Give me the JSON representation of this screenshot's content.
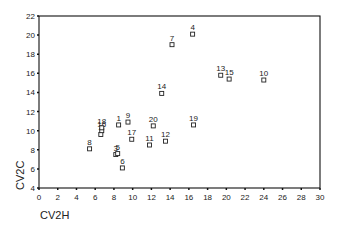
{
  "chart_data": {
    "type": "scatter",
    "title": "",
    "xlabel": "CV2H",
    "ylabel": "CV2C",
    "xlim": [
      0,
      30
    ],
    "ylim": [
      4,
      22
    ],
    "x_ticks": [
      0,
      2,
      4,
      6,
      8,
      10,
      12,
      14,
      16,
      18,
      20,
      22,
      24,
      26,
      28,
      30
    ],
    "y_ticks": [
      4,
      6,
      8,
      10,
      12,
      14,
      16,
      18,
      20,
      22
    ],
    "grid": false,
    "legend": null,
    "marker": "open-square",
    "points": [
      {
        "label": "1",
        "x": 8.5,
        "y": 10.6
      },
      {
        "label": "2",
        "x": 6.6,
        "y": 9.6
      },
      {
        "label": "3",
        "x": 8.2,
        "y": 7.5
      },
      {
        "label": "4",
        "x": 16.4,
        "y": 20.1
      },
      {
        "label": "5",
        "x": 8.4,
        "y": 7.6
      },
      {
        "label": "6",
        "x": 8.9,
        "y": 6.1
      },
      {
        "label": "7",
        "x": 14.2,
        "y": 19.0
      },
      {
        "label": "8",
        "x": 5.4,
        "y": 8.1
      },
      {
        "label": "9",
        "x": 9.5,
        "y": 10.9
      },
      {
        "label": "10",
        "x": 24.0,
        "y": 15.3
      },
      {
        "label": "11",
        "x": 11.8,
        "y": 8.5
      },
      {
        "label": "12",
        "x": 13.5,
        "y": 8.9
      },
      {
        "label": "13",
        "x": 19.4,
        "y": 15.8
      },
      {
        "label": "14",
        "x": 13.1,
        "y": 13.9
      },
      {
        "label": "15",
        "x": 20.3,
        "y": 15.4
      },
      {
        "label": "16",
        "x": 6.7,
        "y": 10.0
      },
      {
        "label": "17",
        "x": 9.9,
        "y": 9.1
      },
      {
        "label": "18",
        "x": 6.7,
        "y": 10.3
      },
      {
        "label": "19",
        "x": 16.5,
        "y": 10.6
      },
      {
        "label": "20",
        "x": 12.2,
        "y": 10.5
      }
    ]
  },
  "colors": {
    "axis": "#111111",
    "marker": "#222222",
    "background": "#ffffff"
  }
}
